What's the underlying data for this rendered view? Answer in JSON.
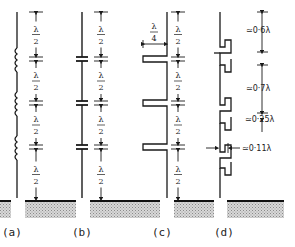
{
  "figure": {
    "panels": [
      {
        "id": "a",
        "label": "(a)",
        "element": "coil",
        "segment_label": {
          "num": "λ",
          "den": "2"
        },
        "segments": 4
      },
      {
        "id": "b",
        "label": "(b)",
        "element": "capacitor",
        "segment_label": {
          "num": "λ",
          "den": "2"
        },
        "segments": 4
      },
      {
        "id": "c",
        "label": "(c)",
        "element": "quarter-wave stub",
        "segment_label": {
          "num": "λ",
          "den": "2"
        },
        "segments": 4,
        "stub_label": {
          "num": "λ",
          "den": "4"
        }
      },
      {
        "id": "d",
        "label": "(d)",
        "element": "folded stub",
        "dims": [
          "≃0·6λ",
          "≃0·7λ",
          "≃0·25λ",
          "≃0·11λ"
        ]
      }
    ],
    "colors": {
      "line": "#1a1a1a",
      "ground_hatch": "#b8b8b8",
      "background": "#ffffff"
    }
  }
}
